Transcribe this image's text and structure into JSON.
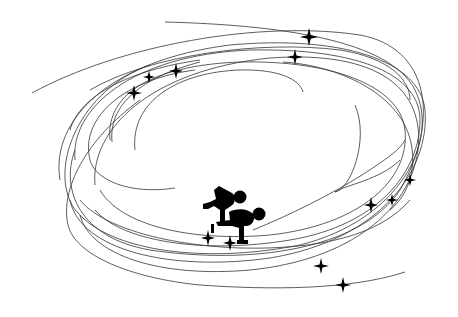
{
  "title": "Speed skating illustration",
  "colors": {
    "background": "#ffffff",
    "ink": "#000000",
    "orbit_stroke": "#333333"
  },
  "icons": {
    "skaters": "speed-skaters-icon",
    "sparkle": "sparkle-star-icon"
  },
  "sparkles": [
    {
      "x": 134,
      "y": 93,
      "r": 7
    },
    {
      "x": 149,
      "y": 77,
      "r": 6
    },
    {
      "x": 176,
      "y": 71,
      "r": 7
    },
    {
      "x": 309,
      "y": 37,
      "r": 8
    },
    {
      "x": 295,
      "y": 57,
      "r": 7
    },
    {
      "x": 410,
      "y": 180,
      "r": 6
    },
    {
      "x": 392,
      "y": 200,
      "r": 6
    },
    {
      "x": 371,
      "y": 205,
      "r": 7
    },
    {
      "x": 208,
      "y": 238,
      "r": 7
    },
    {
      "x": 230,
      "y": 243,
      "r": 7
    },
    {
      "x": 321,
      "y": 266,
      "r": 7
    },
    {
      "x": 343,
      "y": 285,
      "r": 7
    }
  ]
}
